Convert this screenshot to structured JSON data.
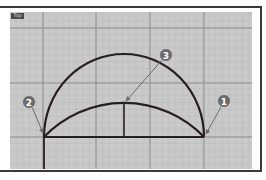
{
  "viewport": {
    "label": "Top",
    "background": "#c9c9c9",
    "minor_grid_color": "#b6b6b6",
    "major_grid_color": "#8e8e8e"
  },
  "geometry": {
    "line_color": "#2a1f1f",
    "large_arc": "semicircular arc spanning base from point 2 to point 1",
    "small_arc": "shallow arc spanning base from point 2 to point 1",
    "base_line": "horizontal line joining endpoints",
    "height_line": "vertical line from small arc apex to base"
  },
  "callouts": [
    {
      "number": "1",
      "target": "right endpoint"
    },
    {
      "number": "2",
      "target": "left endpoint"
    },
    {
      "number": "3",
      "target": "small arc midpoint"
    }
  ],
  "callout_color": "#6b6b6b"
}
